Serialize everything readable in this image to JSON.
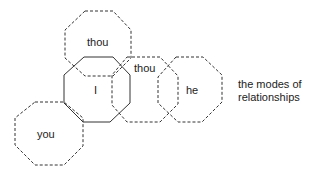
{
  "diagram": {
    "caption": {
      "line1": "the modes of",
      "line2": "relationships"
    },
    "nodes": [
      {
        "id": "thou-top",
        "label": "thou",
        "style": "dashed"
      },
      {
        "id": "i",
        "label": "I",
        "style": "solid"
      },
      {
        "id": "thou-right",
        "label": "thou",
        "style": "dashed"
      },
      {
        "id": "he",
        "label": "he",
        "style": "dashed"
      },
      {
        "id": "you",
        "label": "you",
        "style": "dashed"
      }
    ],
    "colors": {
      "stroke": "#333333",
      "text": "#222222",
      "background": "#ffffff"
    }
  }
}
